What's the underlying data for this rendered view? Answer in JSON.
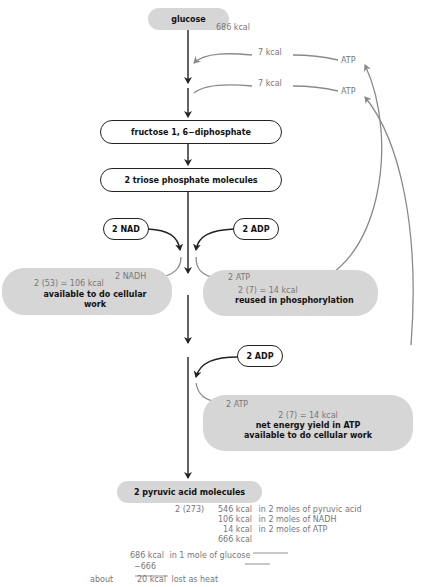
{
  "nodes": {
    "glucose": "glucose",
    "fructose": "fructose 1, 6−diphosphate",
    "triose": "2 triose phosphate molecules",
    "nad": "2 NAD",
    "adp1": "2 ADP",
    "adp2": "2 ADP",
    "pyruvic": "2 pyruvic acid molecules"
  },
  "labels": {
    "glucose_energy": "686 kcal",
    "kcal_in_1": "7 kcal",
    "kcal_in_2": "7 kcal",
    "atp_in_1": "ATP",
    "atp_in_2": "ATP",
    "nadh": "2 NADH",
    "atp_out_1": "2 ATP",
    "atp_out_2": "2 ATP"
  },
  "boxes": {
    "nadh_box": {
      "calc": "2 (53) = 106 kcal",
      "line1": "available to do cellular",
      "line2": "work"
    },
    "atp_reuse_box": {
      "calc": "2 (7) = 14 kcal",
      "line1": "reused in phosphorylation"
    },
    "atp_net_box": {
      "calc": "2 (7) = 14 kcal",
      "line1": "net energy yield in ATP",
      "line2": "available to do cellular work"
    }
  },
  "summary": {
    "multiplier": "2 (273)",
    "rows": [
      {
        "value": "546 kcal",
        "desc": "in 2 moles of pyruvic acid"
      },
      {
        "value": "106 kcal",
        "desc": "in 2 moles of NADH"
      },
      {
        "value": "14 kcal",
        "desc": "in 2 moles of ATP"
      }
    ],
    "total": "666 kcal",
    "glucose_value": "686 kcal",
    "glucose_desc": "in 1 mole of glucose",
    "subtract": "−666",
    "about": "about",
    "heat_value": "20 kcal",
    "heat_desc": "lost as heat"
  },
  "colors": {
    "gray_fill": "#d6d6d6",
    "gray_text": "#777777",
    "arrow_gray": "#8a8a8a",
    "line_dark": "#222222"
  }
}
